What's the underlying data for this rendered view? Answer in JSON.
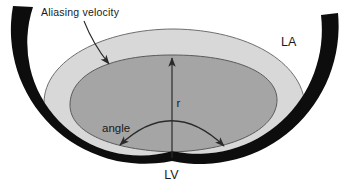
{
  "diagram": {
    "labels": {
      "aliasing_velocity": "Aliasing velocity",
      "left_atrium": "LA",
      "radius": "r",
      "angle": "angle",
      "left_ventricle": "LV"
    },
    "colors": {
      "wall": "#0d0d0d",
      "outer_shell": "#d8d8d8",
      "inner_shell": "#a5a5a5",
      "line": "#2a2a2a",
      "background": "#ffffff"
    }
  }
}
